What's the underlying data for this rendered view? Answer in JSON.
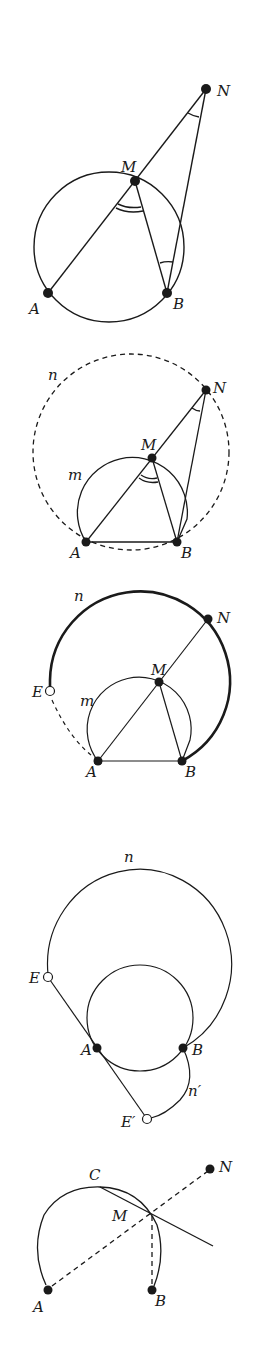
{
  "figure": {
    "panels": [
      {
        "id": "panel-1",
        "labels": {
          "N": "N",
          "M": "M",
          "A": "A",
          "B": "B"
        }
      },
      {
        "id": "panel-2",
        "labels": {
          "n": "n",
          "m": "m",
          "N": "N",
          "M": "M",
          "A": "A",
          "B": "B"
        }
      },
      {
        "id": "panel-3",
        "labels": {
          "n": "n",
          "m": "m",
          "E": "E",
          "N": "N",
          "M": "M",
          "A": "A",
          "B": "B"
        }
      },
      {
        "id": "panel-4",
        "labels": {
          "n": "n",
          "n_prime": "n′",
          "E": "E",
          "E_prime": "E′",
          "A": "A",
          "B": "B"
        }
      },
      {
        "id": "panel-5",
        "labels": {
          "C": "C",
          "N": "N",
          "M": "M",
          "A": "A",
          "B": "B"
        }
      }
    ],
    "colors": {
      "ink": "#1a1a1a",
      "background": "#ffffff"
    }
  }
}
